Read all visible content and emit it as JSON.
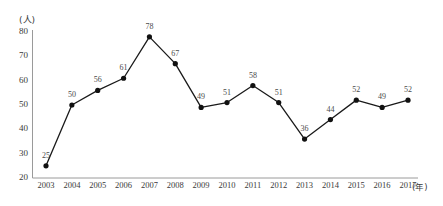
{
  "chart_data": {
    "type": "line",
    "title": "",
    "subtitle": "",
    "xlabel": "(年)",
    "ylabel": "(人)",
    "x_unit": "(年)",
    "y_unit": "(人)",
    "categories": [
      "2003",
      "2004",
      "2005",
      "2006",
      "2007",
      "2008",
      "2009",
      "2010",
      "2011",
      "2012",
      "2013",
      "2014",
      "2015",
      "2016",
      "2017"
    ],
    "values": [
      25,
      50,
      56,
      61,
      78,
      67,
      49,
      51,
      58,
      51,
      36,
      44,
      52,
      49,
      52
    ],
    "point_labels": [
      "25",
      "50",
      "56",
      "61",
      "78",
      "67",
      "49",
      "51",
      "58",
      "51",
      "36",
      "44",
      "52",
      "49",
      "52"
    ],
    "ylim": [
      20,
      80
    ],
    "y_ticks": [
      80,
      70,
      60,
      50,
      40,
      30,
      20
    ],
    "y_tick_labels": [
      "80",
      "70",
      "60",
      "50",
      "40",
      "30",
      "20"
    ],
    "xlim": [
      "2003",
      "2017"
    ],
    "grid": false,
    "legend": null,
    "legend_position": "none",
    "series": [
      {
        "name": "",
        "values": [
          25,
          50,
          56,
          61,
          78,
          67,
          49,
          51,
          58,
          51,
          36,
          44,
          52,
          49,
          52
        ],
        "line_color": "#1a1a1a",
        "marker": "circle",
        "marker_color": "#111111"
      }
    ],
    "axis_color": "#9a9a9a",
    "text_color": "#3a3a3a",
    "background_color": "#ffffff"
  }
}
